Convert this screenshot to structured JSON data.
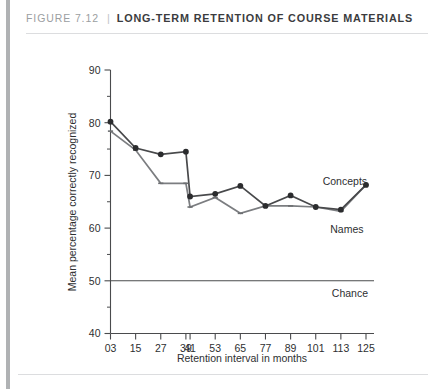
{
  "figure": {
    "number": "FIGURE 7.12",
    "separator": "|",
    "title": "LONG-TERM RETENTION OF COURSE MATERIALS"
  },
  "chart_data": {
    "type": "line",
    "title": "",
    "xlabel": "Retention interval in months",
    "ylabel": "Mean percentage correctly recognized",
    "categories": [
      "03",
      "15",
      "27",
      "39",
      "41",
      "53",
      "65",
      "77",
      "89",
      "101",
      "113",
      "125"
    ],
    "x": [
      3,
      15,
      27,
      39,
      41,
      53,
      65,
      77,
      89,
      101,
      113,
      125
    ],
    "ylim": [
      40,
      90
    ],
    "yticks": [
      40,
      50,
      60,
      70,
      80,
      90
    ],
    "yticks_minor": [
      45,
      55,
      65,
      75,
      85
    ],
    "grid": false,
    "legend": "inline-labels",
    "series": [
      {
        "name": "Concepts",
        "marker": "filled-circle",
        "color": "#48494b",
        "values": [
          80.2,
          75.2,
          74.0,
          74.5,
          66.0,
          66.5,
          68.0,
          64.2,
          66.2,
          64.0,
          63.5,
          68.2
        ]
      },
      {
        "name": "Names",
        "marker": "dash",
        "color": "#7b7d80",
        "values": [
          78.4,
          74.8,
          68.5,
          68.5,
          64.0,
          65.8,
          62.8,
          64.2,
          64.2,
          64.0,
          63.2,
          68.2
        ]
      }
    ],
    "annotations": [
      {
        "label": "Concepts",
        "value": null
      },
      {
        "label": "Names",
        "value": null
      },
      {
        "label": "Chance",
        "value": 50
      }
    ],
    "reference_line": {
      "label": "Chance",
      "value": 50
    }
  }
}
